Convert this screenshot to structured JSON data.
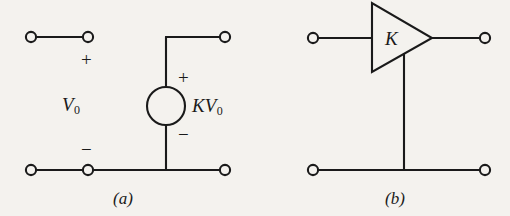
{
  "figure": {
    "background_color": "#f4f2ee",
    "line_color": "#1a1a1a"
  },
  "diagram_a": {
    "caption": "(a)",
    "caption_letter": "a",
    "input_label": "V",
    "input_subscript": "0",
    "source_label": "KV",
    "source_subscript": "0",
    "input_plus": "+",
    "input_minus": "−",
    "source_plus": "+",
    "source_minus": "−",
    "terminals": [
      {
        "name": "input-top-left",
        "x": 31,
        "y": 37
      },
      {
        "name": "input-top-right",
        "x": 88,
        "y": 37
      },
      {
        "name": "output-top-right",
        "x": 225,
        "y": 37
      },
      {
        "name": "input-bottom-left",
        "x": 31,
        "y": 170
      },
      {
        "name": "input-bottom-right",
        "x": 88,
        "y": 170
      },
      {
        "name": "output-bottom-right",
        "x": 225,
        "y": 170
      }
    ],
    "source_circle": {
      "cx": 166,
      "cy": 106,
      "r": 19
    }
  },
  "diagram_b": {
    "caption": "(b)",
    "caption_letter": "b",
    "gain_label": "K",
    "terminals": [
      {
        "name": "input-top-left",
        "x": 313,
        "y": 38
      },
      {
        "name": "output-top-right",
        "x": 485,
        "y": 38
      },
      {
        "name": "input-bottom-left",
        "x": 313,
        "y": 170
      },
      {
        "name": "output-bottom-right",
        "x": 485,
        "y": 170
      }
    ],
    "triangle": {
      "left": 372,
      "top": 3,
      "bottom": 72,
      "apex_x": 432,
      "apex_y": 38
    }
  }
}
